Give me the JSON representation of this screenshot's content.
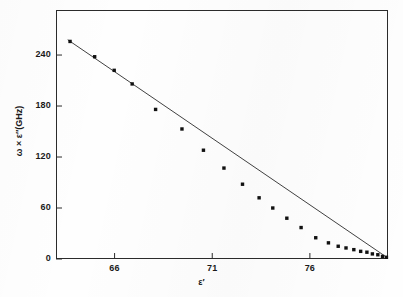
{
  "figure": {
    "background_color": "#fefefe",
    "frame_color": "#2b2b2b",
    "ink_color": "#111111"
  },
  "axes": {
    "x_title": "ε′",
    "y_title": "ω × ε″(GHz)",
    "x_ticks": [
      "66",
      "71",
      "76"
    ],
    "y_ticks": [
      "0",
      "60",
      "120",
      "180",
      "240"
    ]
  },
  "chart_data": {
    "type": "scatter",
    "title": "",
    "subtitle": "",
    "xlabel": "ε′",
    "ylabel": "ω × ε″(GHz)",
    "xlim": [
      63.0,
      80.0
    ],
    "ylim": [
      0,
      293
    ],
    "xticks": [
      66,
      71,
      76
    ],
    "yticks": [
      0,
      60,
      120,
      180,
      240
    ],
    "grid": false,
    "legend": null,
    "marker": "filled-square",
    "marker_color": "#111111",
    "line_color": "#2b2b2b",
    "series": [
      {
        "name": "ωε″ vs ε′",
        "x": [
          63.72,
          64.98,
          65.98,
          66.9,
          68.1,
          69.45,
          70.55,
          71.6,
          72.55,
          73.4,
          74.1,
          74.82,
          75.55,
          76.3,
          76.95,
          77.45,
          77.85,
          78.25,
          78.6,
          78.92,
          79.2,
          79.48,
          79.72,
          79.92
        ],
        "y": [
          256,
          238,
          222,
          206,
          176,
          153,
          128,
          107,
          88,
          72,
          60,
          48,
          37,
          25,
          19,
          15,
          13,
          11,
          9,
          8,
          6,
          5,
          3,
          2
        ]
      }
    ],
    "fit_line": {
      "description": "straight line through data",
      "x_start": 63.6,
      "y_start": 258,
      "x_end": 80.0,
      "y_end": 1
    }
  }
}
